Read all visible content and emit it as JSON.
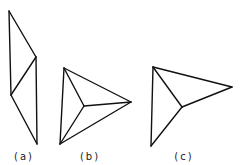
{
  "figures": [
    {
      "id": "a",
      "label": "(a)",
      "label_pos": [
        24,
        151
      ],
      "vertices": {
        "top": [
          9,
          11
        ],
        "right_mid": [
          36,
          57
        ],
        "left_mid": [
          11,
          95
        ],
        "bottom": [
          37,
          144
        ]
      },
      "edges": [
        [
          "top",
          "right_mid"
        ],
        [
          "top",
          "left_mid"
        ],
        [
          "right_mid",
          "left_mid"
        ],
        [
          "right_mid",
          "bottom"
        ],
        [
          "left_mid",
          "bottom"
        ]
      ]
    },
    {
      "id": "b",
      "label": "(b)",
      "label_pos": [
        90,
        151
      ],
      "vertices": {
        "top": [
          64,
          68
        ],
        "right": [
          131,
          102
        ],
        "bottom": [
          60,
          144
        ],
        "center": [
          84,
          106
        ]
      },
      "edges": [
        [
          "top",
          "right"
        ],
        [
          "top",
          "bottom"
        ],
        [
          "right",
          "bottom"
        ],
        [
          "top",
          "center"
        ],
        [
          "right",
          "center"
        ],
        [
          "bottom",
          "center"
        ]
      ]
    },
    {
      "id": "c",
      "label": "(c)",
      "label_pos": [
        184,
        151
      ],
      "vertices": {
        "top": [
          153,
          67
        ],
        "right": [
          232,
          87
        ],
        "bottom": [
          151,
          146
        ],
        "center": [
          182,
          107
        ]
      },
      "edges": [
        [
          "top",
          "right"
        ],
        [
          "top",
          "bottom"
        ],
        [
          "top",
          "center"
        ],
        [
          "right",
          "center"
        ],
        [
          "bottom",
          "center"
        ]
      ]
    }
  ],
  "colors": {
    "stroke": "#111111",
    "background": "#ffffff"
  }
}
